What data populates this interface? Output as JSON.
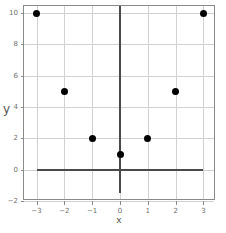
{
  "chart_data": {
    "type": "scatter",
    "title": "",
    "xlabel": "x",
    "ylabel": "y",
    "x": [
      -3,
      -2,
      -1,
      0,
      1,
      2,
      3
    ],
    "values": [
      10,
      5,
      2,
      1,
      2,
      5,
      10
    ],
    "series": [
      {
        "name": "y = x^2 + 1",
        "points": [
          {
            "x": -3,
            "y": 10
          },
          {
            "x": -2,
            "y": 5
          },
          {
            "x": -1,
            "y": 2
          },
          {
            "x": 0,
            "y": 1
          },
          {
            "x": 1,
            "y": 2
          },
          {
            "x": 2,
            "y": 5
          },
          {
            "x": 3,
            "y": 10
          }
        ]
      }
    ],
    "xlim": [
      -3.45,
      3.45
    ],
    "ylim": [
      -2,
      10.45
    ],
    "xticks": [
      -3,
      -2,
      -1,
      0,
      1,
      2,
      3
    ],
    "xticklabels": [
      "−3",
      "−2",
      "−1",
      "0",
      "1",
      "2",
      "3"
    ],
    "yticks": [
      -2,
      0,
      2,
      4,
      6,
      8,
      10
    ],
    "yticklabels": [
      "−2",
      "0",
      "2",
      "4",
      "6",
      "8",
      "10"
    ],
    "grid": true,
    "legend": false,
    "marker": "circle",
    "marker_color": "#000000",
    "grid_color": "#d0d0d0",
    "axis_color": "#4a4a4a",
    "spine_color": "#8a8a8a",
    "emphasized_axes": {
      "x_zero_line": {
        "from_x": -3,
        "to_x": 3,
        "at_y": 0
      },
      "y_zero_line": {
        "from_y": -1.5,
        "to_y": 10.45,
        "at_x": 0
      }
    }
  }
}
